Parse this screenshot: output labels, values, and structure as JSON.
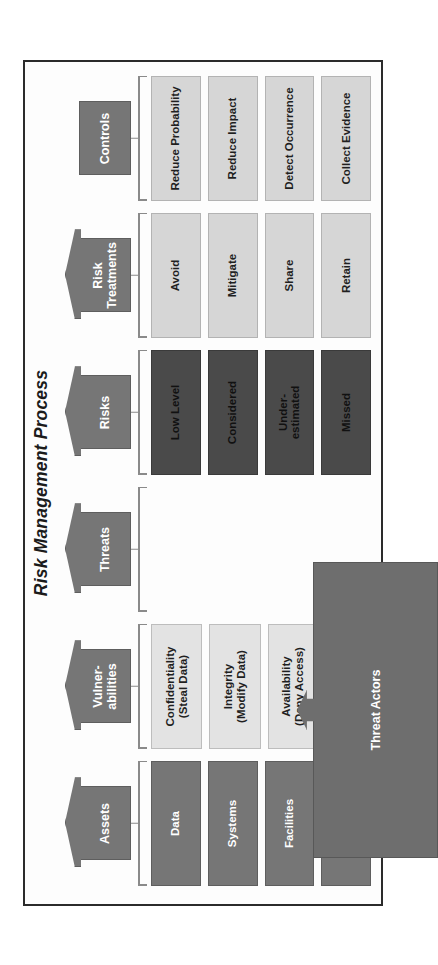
{
  "figure": {
    "title": "Risk Management Process",
    "frame_color": "#2b2b2b",
    "background": "#fdfdfd"
  },
  "colors": {
    "header_gray": "#767676",
    "item_mid_gray": "#767676",
    "item_light_gray": "#d6d6d6",
    "item_pale_gray": "#e3e3e3",
    "item_dark_gray": "#4a4a4a",
    "bracket_gray": "#8a8a8a",
    "threat_actors_gray": "#6e6e6e"
  },
  "columns": [
    {
      "id": "assets",
      "header": "Assets",
      "has_arrow": true,
      "tone": "tone-mid",
      "items": [
        "Data",
        "Systems",
        "Facilities",
        "People"
      ]
    },
    {
      "id": "vulnerabilities",
      "header": "Vulner-\nabilities",
      "has_arrow": true,
      "tone": "tone-pale",
      "items": [
        "Confidentiality\n(Steal Data)",
        "Integrity\n(Modify Data)",
        "Availability\n(Deny Access)"
      ]
    },
    {
      "id": "threats",
      "header": "Threats",
      "has_arrow": true,
      "tone": "tone-pale",
      "items": []
    },
    {
      "id": "risks",
      "header": "Risks",
      "has_arrow": true,
      "tone": "tone-dark",
      "items": [
        "Low Level",
        "Considered",
        "Under-\nestimated",
        "Missed"
      ]
    },
    {
      "id": "risk-treatments",
      "header": "Risk\nTreatments",
      "has_arrow": true,
      "tone": "tone-light",
      "items": [
        "Avoid",
        "Mitigate",
        "Share",
        "Retain"
      ]
    },
    {
      "id": "controls",
      "header": "Controls",
      "has_arrow": false,
      "tone": "tone-light",
      "items": [
        "Reduce Probability",
        "Reduce Impact",
        "Detect Occurrence",
        "Collect Evidence"
      ]
    }
  ],
  "threat_actors": {
    "label": "Threat Actors"
  }
}
